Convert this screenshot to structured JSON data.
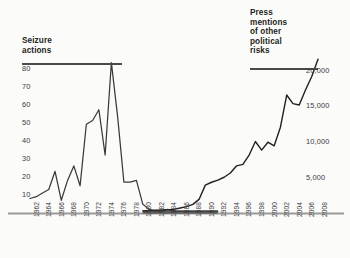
{
  "chart_data": {
    "type": "line",
    "title": "",
    "background": "#fbfbfa",
    "grid": false,
    "legend_position": "inline-axis-labels",
    "x": [
      1962,
      1963,
      1964,
      1965,
      1966,
      1967,
      1968,
      1969,
      1970,
      1971,
      1972,
      1973,
      1974,
      1975,
      1976,
      1977,
      1978,
      1979,
      1980,
      1981,
      1982,
      1983,
      1984,
      1985,
      1986,
      1987,
      1988,
      1989,
      1990,
      1991,
      1992,
      1993,
      1994,
      1995,
      1996,
      1997,
      1998,
      1999,
      2000,
      2001,
      2002,
      2003,
      2004,
      2005,
      2006,
      2007,
      2008
    ],
    "xlabel": "",
    "xticks": [
      "1962",
      "1964",
      "1966",
      "1968",
      "1970",
      "1972",
      "1974",
      "1976",
      "1978",
      "1980",
      "1982",
      "1984",
      "1986",
      "1988",
      "1990",
      "1992",
      "1994",
      "1996",
      "1998",
      "2000",
      "2002",
      "2004",
      "2006",
      "2008"
    ],
    "axes": [
      {
        "id": "left",
        "label": "Seizure\nactions",
        "ticks": [
          10,
          20,
          30,
          40,
          50,
          60,
          70,
          80
        ],
        "ylim": [
          0,
          88
        ],
        "side": "left"
      },
      {
        "id": "right",
        "label": "Press\nmentions\nof other\npolitical\nrisks",
        "ticks": [
          "5,000",
          "10,000",
          "15,000",
          "20,000"
        ],
        "tick_values": [
          5000,
          10000,
          15000,
          20000
        ],
        "ylim": [
          0,
          23000
        ],
        "side": "right"
      }
    ],
    "series": [
      {
        "name": "Seizure actions",
        "axis": "left",
        "color": "#3a3a3a",
        "values": [
          8,
          9,
          11,
          13,
          23,
          7,
          18,
          26,
          15,
          49,
          51,
          57,
          32,
          83,
          53,
          17,
          17,
          18,
          5,
          2,
          1,
          1,
          2,
          1,
          1,
          1,
          1,
          1,
          1,
          1,
          1,
          null,
          null,
          null,
          null,
          null,
          null,
          null,
          null,
          null,
          null,
          null,
          null,
          null,
          null,
          null,
          null
        ]
      },
      {
        "name": "Press mentions of other political risks",
        "axis": "right",
        "color": "#231f20",
        "values": [
          null,
          null,
          null,
          null,
          null,
          null,
          null,
          null,
          null,
          null,
          null,
          null,
          null,
          null,
          null,
          null,
          null,
          null,
          300,
          350,
          400,
          420,
          450,
          500,
          700,
          900,
          1200,
          1900,
          3900,
          4300,
          4600,
          5000,
          5600,
          6600,
          6800,
          8100,
          10000,
          8800,
          9900,
          9400,
          12000,
          16500,
          15300,
          15100,
          17200,
          19100,
          21500
        ]
      }
    ],
    "annotations": [
      {
        "name": "overlap-band",
        "from": 1980,
        "to": 1992,
        "note": "thick dark segment where both series sit near baseline"
      }
    ]
  },
  "axis_titles": {
    "left": "Seizure\nactions",
    "right": "Press\nmentions\nof other\npolitical\nrisks"
  },
  "left_ticks": [
    "80",
    "70",
    "60",
    "50",
    "40",
    "30",
    "20",
    "10"
  ],
  "right_ticks": [
    "20,000",
    "15,000",
    "10,000",
    "5,000"
  ],
  "x_ticks": [
    "1962",
    "1964",
    "1966",
    "1968",
    "1970",
    "1972",
    "1974",
    "1976",
    "1978",
    "1980",
    "1982",
    "1984",
    "1986",
    "1988",
    "1990",
    "1992",
    "1994",
    "1996",
    "1998",
    "2000",
    "2002",
    "2004",
    "2006",
    "2008"
  ],
  "colors": {
    "background": "#fbfbfa",
    "ink": "#231f20",
    "line": "#3a3a3a",
    "rule": "#9a9a98"
  }
}
